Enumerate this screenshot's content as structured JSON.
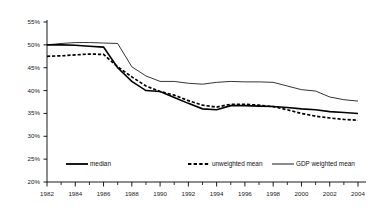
{
  "chart_data": {
    "type": "line",
    "title": "",
    "subtitle": "",
    "xlabel": "",
    "ylabel": "",
    "xlim": [
      1982,
      2004
    ],
    "ylim": [
      20,
      55
    ],
    "grid": false,
    "legend_position": "bottom",
    "y_ticks": [
      "20%",
      "25%",
      "30%",
      "35%",
      "40%",
      "45%",
      "50%",
      "55%"
    ],
    "y_tick_values": [
      20,
      25,
      30,
      35,
      40,
      45,
      50,
      55
    ],
    "x_ticks": [
      "1982",
      "1984",
      "1986",
      "1988",
      "1990",
      "1992",
      "1994",
      "1996",
      "1998",
      "2000",
      "2002",
      "2004"
    ],
    "x_tick_values": [
      1982,
      1984,
      1986,
      1988,
      1990,
      1992,
      1994,
      1996,
      1998,
      2000,
      2002,
      2004
    ],
    "x_minor_tick_values": [
      1983,
      1985,
      1987,
      1989,
      1991,
      1993,
      1995,
      1997,
      1999,
      2001,
      2003
    ],
    "x": [
      1982,
      1983,
      1984,
      1985,
      1986,
      1987,
      1988,
      1989,
      1990,
      1991,
      1992,
      1993,
      1994,
      1995,
      1996,
      1997,
      1998,
      1999,
      2000,
      2001,
      2002,
      2003,
      2004
    ],
    "series": [
      {
        "name": "median",
        "style": "solid",
        "color": "#000000",
        "width": 1.6,
        "values": [
          50.0,
          50.0,
          49.9,
          49.7,
          49.5,
          45.0,
          42.0,
          40.0,
          39.8,
          38.5,
          37.2,
          36.0,
          35.8,
          36.7,
          36.7,
          36.6,
          36.5,
          36.3,
          36.0,
          35.8,
          35.4,
          35.2,
          35.0
        ]
      },
      {
        "name": "unweighted mean",
        "style": "dashed",
        "color": "#000000",
        "width": 1.7,
        "values": [
          47.5,
          47.6,
          47.8,
          48.0,
          47.9,
          45.2,
          43.0,
          41.0,
          39.8,
          39.0,
          37.8,
          36.8,
          36.4,
          37.0,
          37.0,
          36.8,
          36.5,
          35.8,
          35.0,
          34.4,
          34.0,
          33.7,
          33.5
        ]
      },
      {
        "name": "GDP weighted mean",
        "style": "solid",
        "color": "#000000",
        "width": 0.8,
        "values": [
          50.0,
          50.3,
          50.5,
          50.5,
          50.4,
          50.3,
          45.2,
          43.2,
          42.0,
          42.0,
          41.6,
          41.4,
          41.8,
          42.0,
          41.9,
          41.9,
          41.8,
          41.0,
          40.2,
          39.9,
          38.6,
          38.0,
          37.7
        ]
      }
    ],
    "legend": [
      {
        "label": "median",
        "style": "solid",
        "width": 1.8
      },
      {
        "label": "unweighted mean",
        "style": "dashed",
        "width": 1.8
      },
      {
        "label": "GDP weighted mean",
        "style": "solid",
        "width": 0.9
      }
    ],
    "axis_color": "#000000",
    "background_color": "#ffffff"
  }
}
